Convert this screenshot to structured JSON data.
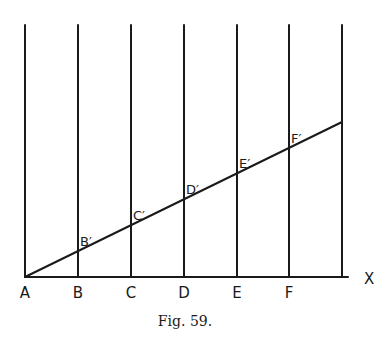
{
  "figure": {
    "caption": "Fig. 59.",
    "axis_label": "X",
    "colors": {
      "ink": "#1a1a1a",
      "paper": "#ffffff"
    },
    "baseline": {
      "y": 277,
      "x_start": 25,
      "x_end": 348
    },
    "vertical_lines": {
      "top_y": 25,
      "x": [
        25,
        78,
        131,
        184,
        237,
        289,
        342
      ]
    },
    "diagonal": {
      "from": [
        25,
        277
      ],
      "to": [
        342,
        122
      ]
    },
    "base_points": [
      {
        "label": "A",
        "x": 25
      },
      {
        "label": "B",
        "x": 78
      },
      {
        "label": "C",
        "x": 131
      },
      {
        "label": "D",
        "x": 184
      },
      {
        "label": "E",
        "x": 237
      },
      {
        "label": "F",
        "x": 289
      }
    ],
    "intersection_points": [
      {
        "label": "B′",
        "x": 78,
        "y": 251
      },
      {
        "label": "C′",
        "x": 131,
        "y": 225
      },
      {
        "label": "D′",
        "x": 184,
        "y": 199
      },
      {
        "label": "E′",
        "x": 237,
        "y": 173
      },
      {
        "label": "F′",
        "x": 289,
        "y": 148
      }
    ]
  }
}
